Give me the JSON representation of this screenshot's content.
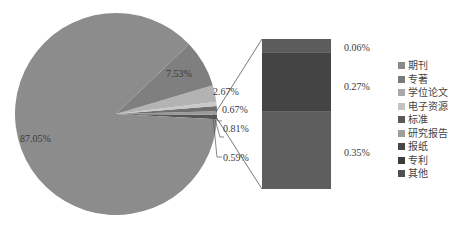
{
  "chart_data": {
    "type": "bar-of-pie",
    "title": "",
    "pie": {
      "slices": [
        {
          "name": "期刊",
          "value": 87.05,
          "label": "87.05%",
          "color": "#8c8c8c"
        },
        {
          "name": "专著",
          "value": 7.53,
          "label": "7.53%",
          "color": "#7f7f7f"
        },
        {
          "name": "学位论文",
          "value": 2.67,
          "label": "2.67%",
          "color": "#b3b3b3"
        },
        {
          "name": "电子资源",
          "value": 0.67,
          "label": "0.67%",
          "color": "#c8c8c8"
        },
        {
          "name": "标准",
          "value": 0.81,
          "label": "0.81%",
          "color": "#6e6e6e"
        },
        {
          "name": "研究报告",
          "value": 0.59,
          "label": "0.59%",
          "color": "#9a9a9a"
        },
        {
          "name": "其他(合计)",
          "value": 0.68,
          "label": "",
          "color": "#555555"
        }
      ]
    },
    "bar": {
      "segments": [
        {
          "name": "其他",
          "value": 0.06,
          "label": "0.06%",
          "color": "#5c5c5c"
        },
        {
          "name": "专利",
          "value": 0.27,
          "label": "0.27%",
          "color": "#444444"
        },
        {
          "name": "报纸",
          "value": 0.35,
          "label": "0.35%",
          "color": "#5e5e5e"
        }
      ]
    },
    "legend": {
      "position": "right",
      "entries": [
        {
          "name": "期刊",
          "color": "#8a8a8a"
        },
        {
          "name": "专著",
          "color": "#7a7a7a"
        },
        {
          "name": "学位论文",
          "color": "#a8a8a8"
        },
        {
          "name": "电子资源",
          "color": "#c4c4c4"
        },
        {
          "name": "标准",
          "color": "#5a5a5a"
        },
        {
          "name": "研究报告",
          "color": "#9e9e9e"
        },
        {
          "name": "报纸",
          "color": "#484848"
        },
        {
          "name": "专利",
          "color": "#3c3c3c"
        },
        {
          "name": "其他",
          "color": "#505050"
        }
      ]
    }
  }
}
